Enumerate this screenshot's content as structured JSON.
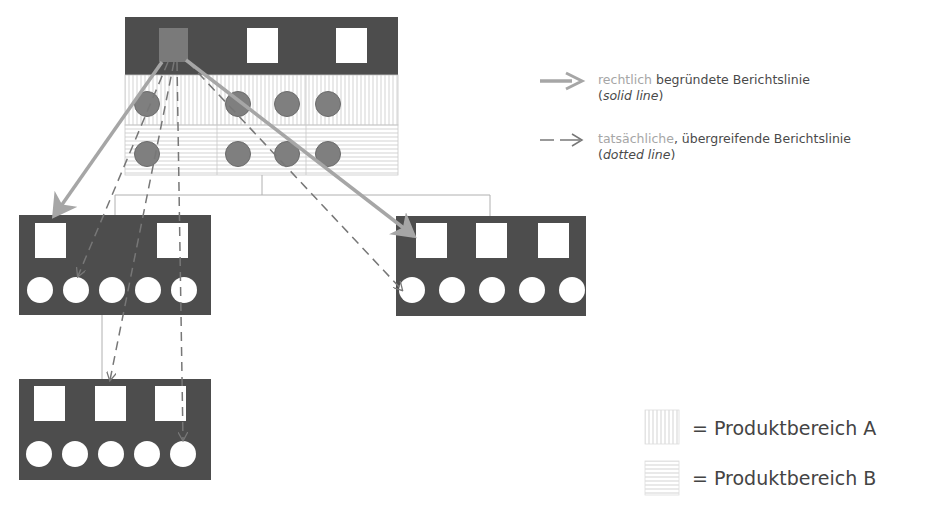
{
  "legend": {
    "solid": {
      "highlight": "rechtlich",
      "rest": " begründete Berichtslinie",
      "paren_open": "(",
      "italic": "solid line",
      "paren_close": ")"
    },
    "dotted": {
      "highlight": "tatsächliche",
      "rest": ", übergreifende Berichtslinie",
      "paren_open": "(",
      "italic": "dotted line",
      "paren_close": ")"
    }
  },
  "areas": {
    "a": "= Produktbereich A",
    "b": "= Produktbereich B"
  },
  "colors": {
    "box_fill": "#4d4d4d",
    "node_circle": "#7f7f7f",
    "solid_arrow": "#a6a6a6",
    "dotted_arrow": "#777777",
    "connector": "#b0b0b0"
  }
}
